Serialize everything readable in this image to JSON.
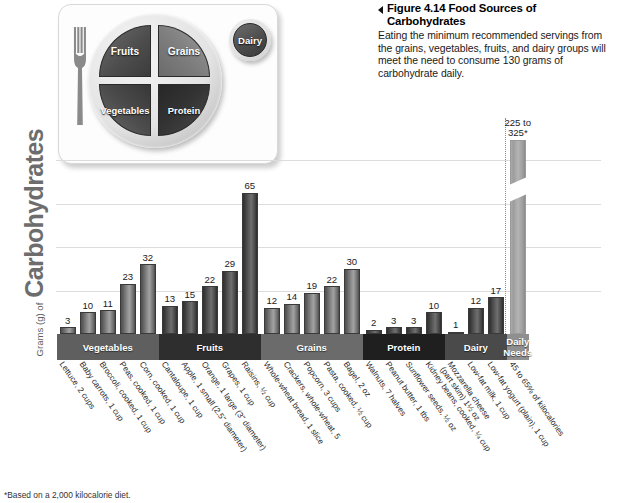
{
  "caption": {
    "marker": "left-triangle",
    "title": "Figure 4.14  Food Sources of Carbohydrates",
    "body": "Eating the minimum recommended servings from the grains, vegetables, fruits, and dairy groups will meet the need to consume 130 grams of carbohydrate daily."
  },
  "plate": {
    "fruits": "Fruits",
    "vegetables": "Vegetables",
    "grains": "Grains",
    "protein": "Protein",
    "dairy": "Dairy"
  },
  "axis": {
    "title_small": "Grams (g) of",
    "title_large": "Carbohydrates"
  },
  "footnote": "*Based on a 2,000 kilocalorie diet.",
  "chart_data": {
    "type": "bar",
    "title": "Food Sources of Carbohydrates",
    "xlabel": "",
    "ylabel": "Grams (g) of Carbohydrates",
    "ylim": [
      0,
      80
    ],
    "grid": true,
    "gridlines": [
      20,
      40,
      60,
      80
    ],
    "legend": "none",
    "note": "Final bar uses a broken axis; its true value is 225 to 325 g.",
    "categories": [
      "Lettuce, 2 cups",
      "Baby carrots, 1 cup",
      "Broccoli, cooked, 1 cup",
      "Peas, cooked, 1 cup",
      "Corn, cooked, 1 cup",
      "Cantaloupe, 1 cup",
      "Apple, 1 small (2.5\" diameter)",
      "Orange, 1 large (3\" diameter)",
      "Grapes, 1 cup",
      "Raisins, ½ cup",
      "Whole-wheat bread, 1 slice",
      "Crackers, whole-wheat, 5",
      "Popcorn, 3 cups",
      "Pasta, cooked, ½ cup",
      "Bagel, 2 oz",
      "Walnuts, 7 halves",
      "Peanut butter, 1 tbs",
      "Sunflower seeds, ½ oz",
      "Kidney beans, cooked, ¼ cup",
      "Mozzarella cheese (part skim) 1½ oz",
      "Low-fat milk, 1 cup",
      "Low-fat yogurt (plain), 1 cup",
      "45 to 65% of kilocalories"
    ],
    "values": [
      3,
      10,
      11,
      23,
      32,
      13,
      15,
      22,
      29,
      65,
      12,
      14,
      19,
      22,
      30,
      2,
      3,
      3,
      10,
      1,
      12,
      17,
      275
    ],
    "value_labels": [
      "3",
      "10",
      "11",
      "23",
      "32",
      "13",
      "15",
      "22",
      "29",
      "65",
      "12",
      "14",
      "19",
      "22",
      "30",
      "2",
      "3",
      "3",
      "10",
      "1",
      "12",
      "17",
      "225 to 325*"
    ],
    "groups": [
      {
        "label": "Vegetables",
        "start": 0,
        "end": 4,
        "shade": "#5f5f5f"
      },
      {
        "label": "Fruits",
        "start": 5,
        "end": 9,
        "shade": "#2e2e2e"
      },
      {
        "label": "Grains",
        "start": 10,
        "end": 14,
        "shade": "#6b6b6b"
      },
      {
        "label": "Protein",
        "start": 15,
        "end": 18,
        "shade": "#1f1f1f"
      },
      {
        "label": "Dairy",
        "start": 19,
        "end": 21,
        "shade": "#4a4a4a"
      },
      {
        "label": "Daily Needs",
        "label_line1": "Daily",
        "label_line2": "Needs",
        "start": 22,
        "end": 22,
        "shade": "#8f8f8f"
      }
    ]
  }
}
